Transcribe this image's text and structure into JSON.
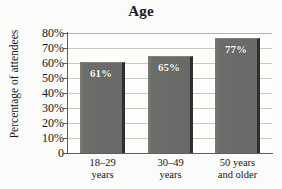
{
  "chart_data": {
    "type": "bar",
    "title": "Age",
    "xlabel": "",
    "ylabel": "Percentage of attendees",
    "categories": [
      "18–29 years",
      "30–49 years",
      "50 years and older"
    ],
    "category_lines": [
      [
        "18–29",
        "years"
      ],
      [
        "30–49",
        "years"
      ],
      [
        "50 years",
        "and older"
      ]
    ],
    "values": [
      61,
      65,
      77
    ],
    "value_labels": [
      "61%",
      "65%",
      "77%"
    ],
    "ylim": [
      0,
      80
    ],
    "ytick_values": [
      80,
      70,
      60,
      50,
      40,
      30,
      20,
      10,
      0
    ],
    "ytick_labels": [
      "80%",
      "70%",
      "60%",
      "50%",
      "40%",
      "30%",
      "20%",
      "10%",
      "0"
    ],
    "grid": true,
    "grid_axis": "y",
    "legend": "none",
    "colors": {
      "bar_fill": "#6d6d6b",
      "bar_edge": "#2e2e2e",
      "gridline": "#c9c9c4",
      "axis": "#5e5e58",
      "background": "#fbfbfa",
      "text": "#151515",
      "value_label": "#ffffff"
    }
  }
}
